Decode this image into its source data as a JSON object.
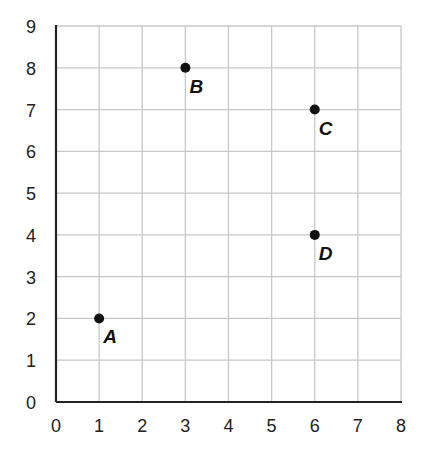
{
  "chart_data": {
    "type": "scatter",
    "title": "",
    "xlabel": "",
    "ylabel": "",
    "xlim": [
      0,
      8
    ],
    "ylim": [
      0,
      9
    ],
    "grid": true,
    "x_ticks": [
      "0",
      "1",
      "2",
      "3",
      "4",
      "5",
      "6",
      "7",
      "8"
    ],
    "y_ticks": [
      "0",
      "1",
      "2",
      "3",
      "4",
      "5",
      "6",
      "7",
      "8",
      "9"
    ],
    "points": [
      {
        "label": "A",
        "x": 1,
        "y": 2
      },
      {
        "label": "B",
        "x": 3,
        "y": 8
      },
      {
        "label": "C",
        "x": 6,
        "y": 7
      },
      {
        "label": "D",
        "x": 6,
        "y": 4
      }
    ]
  },
  "colors": {
    "grid": "#c8c8c8",
    "axis": "#222222",
    "point": "#111111"
  }
}
